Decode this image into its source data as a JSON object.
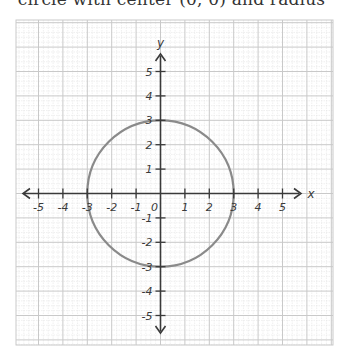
{
  "caption": "circle with center (0, 0) and radius",
  "colors": {
    "background": "#ffffff",
    "grid_major": "#c9c9c9",
    "grid_minor": "#e6e6e6",
    "axis": "#3a3a3a",
    "circle": "#8a8a8a",
    "text": "#3a3a3a"
  },
  "chart_data": {
    "type": "line",
    "title": "",
    "xlabel": "x",
    "ylabel": "y",
    "xlim": [
      -5.8,
      7.2
    ],
    "ylim": [
      -6.2,
      7.0
    ],
    "grid": true,
    "legend": null,
    "x_ticks": [
      -5,
      -4,
      -3,
      -2,
      -1,
      0,
      1,
      2,
      3,
      4,
      5
    ],
    "y_ticks": [
      -5,
      -4,
      -3,
      -2,
      -1,
      1,
      2,
      3,
      4,
      5
    ],
    "x_tick_labels": [
      "-5",
      "-4",
      "-3",
      "-2",
      "-1",
      "0",
      "1",
      "2",
      "3",
      "4",
      "5"
    ],
    "y_tick_labels": [
      "-5",
      "-4",
      "-3",
      "-2",
      "-1",
      "1",
      "2",
      "3",
      "4",
      "5"
    ],
    "origin_label": "0",
    "series": [
      {
        "name": "circle",
        "shape": "circle",
        "center": [
          0,
          0
        ],
        "radius": 3,
        "equation": "x^2 + y^2 = 9"
      }
    ]
  }
}
